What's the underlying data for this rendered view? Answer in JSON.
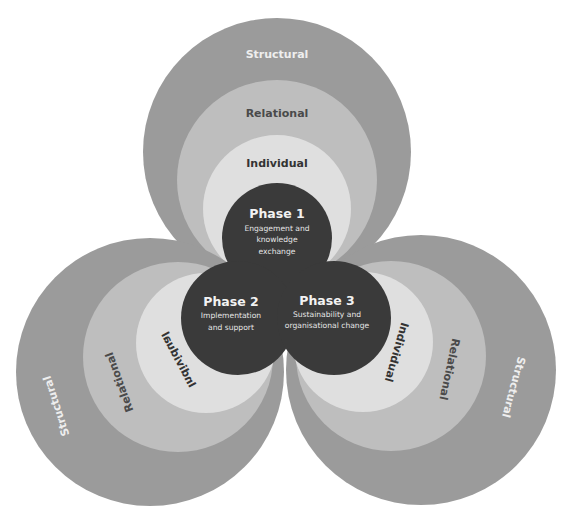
{
  "colors": {
    "structural": "#9b9b9b",
    "relational": "#bebebe",
    "individual": "#dfdfdf",
    "core": "#3a3a3a",
    "background": "#ffffff"
  },
  "levels": {
    "structural": "Structural",
    "relational": "Relational",
    "individual": "Individual"
  },
  "phases": [
    {
      "title": "Phase 1",
      "lines": [
        "Engagement and",
        "knowledge",
        "exchange"
      ]
    },
    {
      "title": "Phase 2",
      "lines": [
        "Implementation",
        "and support"
      ]
    },
    {
      "title": "Phase 3",
      "lines": [
        "Sustainability and",
        "organisational change"
      ]
    }
  ]
}
